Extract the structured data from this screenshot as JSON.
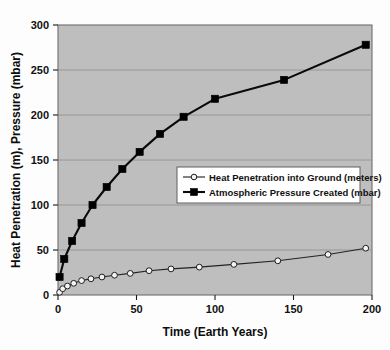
{
  "chart_data": {
    "type": "line",
    "title": "",
    "xlabel": "Time (Earth Years)",
    "ylabel": "Heat Penetration (m), Pressure (mbar)",
    "xlim": [
      0,
      200
    ],
    "ylim": [
      0,
      300
    ],
    "xticks": [
      "0",
      "50",
      "100",
      "150",
      "200"
    ],
    "xtick_values": [
      0,
      50,
      100,
      150,
      200
    ],
    "yticks": [
      "0",
      "50",
      "100",
      "150",
      "200",
      "250",
      "300"
    ],
    "ytick_values": [
      0,
      50,
      100,
      150,
      200,
      250,
      300
    ],
    "grid": "horizontal",
    "legend_position": "center-right",
    "plot_background": "#bebebe",
    "figure_background": "#fdfdfd",
    "series": [
      {
        "name": "Heat Penetration into Ground (meters)",
        "marker": "open-circle",
        "color": "#1d1d1d",
        "x": [
          1,
          3,
          6,
          10,
          15,
          21,
          28,
          36,
          46,
          58,
          72,
          90,
          112,
          140,
          172,
          196
        ],
        "values": [
          3,
          7,
          10,
          13,
          16,
          18,
          20,
          22,
          24,
          27,
          29,
          31,
          34,
          38,
          45,
          52
        ]
      },
      {
        "name": "Atmospheric Pressure Created (mbar)",
        "marker": "filled-square",
        "color": "#0a0a0a",
        "x": [
          1,
          4,
          9,
          15,
          22,
          31,
          41,
          52,
          65,
          80,
          100,
          144,
          196
        ],
        "values": [
          20,
          40,
          60,
          80,
          100,
          120,
          140,
          159,
          179,
          198,
          218,
          239,
          278
        ]
      }
    ]
  },
  "legend": {
    "items": [
      {
        "label": "Heat Penetration into Ground (meters)",
        "marker": "open-circle"
      },
      {
        "label": "Atmospheric Pressure Created (mbar)",
        "marker": "filled-square"
      }
    ]
  },
  "axes": {
    "x_title": "Time (Earth Years)",
    "y_title": "Heat Penetration (m), Pressure (mbar)",
    "x_tick_labels": [
      "0",
      "50",
      "100",
      "150",
      "200"
    ],
    "y_tick_labels": [
      "300",
      "250",
      "200",
      "150",
      "100",
      "50",
      "0"
    ]
  }
}
